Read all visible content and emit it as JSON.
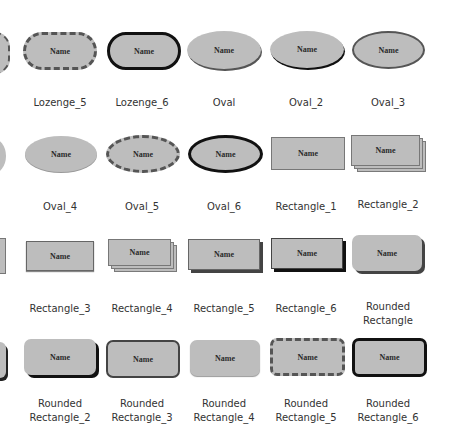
{
  "shape_text": "Name",
  "colors": {
    "fill": "#bdbdbd",
    "border_dark": "#555555",
    "border_black": "#111111",
    "shadow": "#222222",
    "label_text": "#333333"
  },
  "rows": [
    {
      "items": [
        {
          "label": "Lozenge_5",
          "style": "lozenge-dashed"
        },
        {
          "label": "Lozenge_6",
          "style": "lozenge-thick"
        },
        {
          "label": "Oval",
          "style": "oval-shadow"
        },
        {
          "label": "Oval_2",
          "style": "oval-shadow-dark"
        },
        {
          "label": "Oval_3",
          "style": "oval-border"
        }
      ]
    },
    {
      "items": [
        {
          "label": "Oval_4",
          "style": "oval-plain"
        },
        {
          "label": "Oval_5",
          "style": "oval-dashed"
        },
        {
          "label": "Oval_6",
          "style": "oval-thick"
        },
        {
          "label": "Rectangle_1",
          "style": "rect-plain"
        },
        {
          "label": "Rectangle_2",
          "style": "rect-stack"
        }
      ]
    },
    {
      "items": [
        {
          "label": "Rectangle_3",
          "style": "rect-border"
        },
        {
          "label": "Rectangle_4",
          "style": "rect-stack"
        },
        {
          "label": "Rectangle_5",
          "style": "rect-shadow"
        },
        {
          "label": "Rectangle_6",
          "style": "rect-shadow-dark"
        },
        {
          "label": "Rounded Rectangle",
          "style": "rrect-shadow"
        }
      ]
    },
    {
      "items": [
        {
          "label_line1": "Rounded",
          "label_line2": "Rectangle_2",
          "style": "rrect-shadow-dark"
        },
        {
          "label_line1": "Rounded",
          "label_line2": "Rectangle_3",
          "style": "rrect-border"
        },
        {
          "label_line1": "Rounded",
          "label_line2": "Rectangle_4",
          "style": "rrect-plain"
        },
        {
          "label_line1": "Rounded",
          "label_line2": "Rectangle_5",
          "style": "rrect-dashed"
        },
        {
          "label_line1": "Rounded",
          "label_line2": "Rectangle_6",
          "style": "rrect-thick"
        }
      ]
    }
  ]
}
